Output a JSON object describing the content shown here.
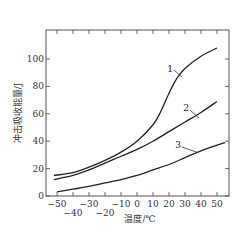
{
  "chart_data": {
    "type": "line",
    "title": "",
    "xlabel": "温度/℃",
    "ylabel": "冲击吸收能量/J",
    "xlim": [
      -53,
      57
    ],
    "ylim": [
      0,
      120
    ],
    "grid": false,
    "legend": "inline numeric labels on curves",
    "x_ticks": [
      -50,
      -40,
      -30,
      -20,
      -10,
      0,
      10,
      20,
      30,
      40,
      50
    ],
    "x_tick_labels_row1": [
      "-50",
      "-30",
      "-10",
      "0",
      "10",
      "20",
      "30",
      "40",
      "50"
    ],
    "x_tick_labels_row2": [
      "-40",
      "-20"
    ],
    "y_ticks": [
      0,
      20,
      40,
      60,
      80,
      100
    ],
    "y_tick_labels": [
      "0",
      "20",
      "40",
      "60",
      "80",
      "100"
    ],
    "series": [
      {
        "name": "1",
        "x": [
          -52,
          -40,
          -30,
          -20,
          -10,
          0,
          10,
          15,
          20,
          25,
          30,
          40,
          50
        ],
        "y": [
          15,
          17,
          21,
          26,
          32,
          40,
          52,
          62,
          75,
          86,
          93,
          102,
          108
        ]
      },
      {
        "name": "2",
        "x": [
          -52,
          -40,
          -30,
          -20,
          -10,
          0,
          10,
          20,
          30,
          40,
          50
        ],
        "y": [
          12,
          15,
          19,
          24,
          29,
          34,
          40,
          47,
          54,
          61,
          69
        ]
      },
      {
        "name": "3",
        "x": [
          -50,
          -40,
          -30,
          -20,
          -10,
          0,
          10,
          20,
          30,
          40,
          55
        ],
        "y": [
          3,
          5,
          7,
          9.5,
          12,
          15,
          19,
          23,
          28,
          33,
          39
        ]
      }
    ]
  },
  "colors": {
    "line": "#222222",
    "background": "#ffffff"
  }
}
